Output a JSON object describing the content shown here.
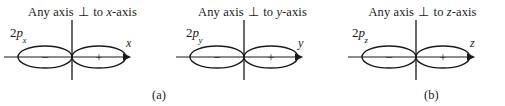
{
  "figure": {
    "background_color": "#ffffff",
    "ink_color": "#1a1a1a",
    "panels": [
      {
        "id": "2px",
        "heading_prefix": "Any axis",
        "heading_perp_symbol": "⊥",
        "heading_middle": "to",
        "heading_axis_letter": "x",
        "heading_suffix": "-axis",
        "orbital_prefix": "2",
        "orbital_p": "p",
        "orbital_subscript": "x",
        "left_lobe_sign": "−",
        "right_lobe_sign": "+",
        "axis_arrow_label": "x"
      },
      {
        "id": "2py",
        "heading_prefix": "Any axis",
        "heading_perp_symbol": "⊥",
        "heading_middle": "to",
        "heading_axis_letter": "y",
        "heading_suffix": "-axis",
        "orbital_prefix": "2",
        "orbital_p": "p",
        "orbital_subscript": "y",
        "left_lobe_sign": "−",
        "right_lobe_sign": "+",
        "axis_arrow_label": "y"
      },
      {
        "id": "2pz",
        "heading_prefix": "Any axis",
        "heading_perp_symbol": "⊥",
        "heading_middle": "to",
        "heading_axis_letter": "z",
        "heading_suffix": "-axis",
        "orbital_prefix": "2",
        "orbital_p": "p",
        "orbital_subscript": "z",
        "left_lobe_sign": "−",
        "right_lobe_sign": "+",
        "axis_arrow_label": "z"
      }
    ],
    "captions": {
      "a": "(a)",
      "b": "(b)"
    }
  }
}
